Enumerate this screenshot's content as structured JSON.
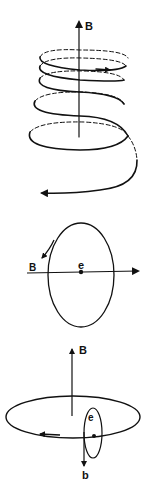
{
  "figure": {
    "panels": [
      {
        "id": "helix",
        "description": "Electron spiraling (helical gyration) along magnetic field B",
        "labels": {
          "field": "B"
        }
      },
      {
        "id": "orbit-side",
        "description": "Electron e gyrating in a circular orbit viewed edge-on, with field B and axis arrow",
        "labels": {
          "field": "B",
          "particle": "e"
        }
      },
      {
        "id": "orbit-with-induced-field",
        "description": "Large orbit in plane perpendicular to B, with electron e orbit producing induced field b",
        "labels": {
          "field": "B",
          "particle": "e",
          "induced_field": "b"
        }
      }
    ]
  },
  "colors": {
    "stroke": "#111111",
    "background": "#ffffff"
  }
}
